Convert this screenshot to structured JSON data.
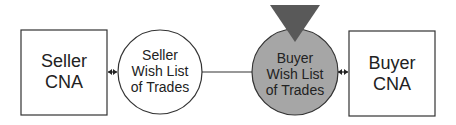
{
  "seller_cna": {
    "line1": "Seller",
    "line2": "CNA"
  },
  "seller_wish_list": {
    "line1": "Seller",
    "line2": "Wish List",
    "line3": "of Trades"
  },
  "buyer_wish_list": {
    "line1": "Buyer",
    "line2": "Wish List",
    "line3": "of Trades",
    "fill": "#a6a6a6"
  },
  "buyer_cna": {
    "line1": "Buyer",
    "line2": "CNA"
  },
  "marker": {
    "shape": "down-triangle",
    "fill": "#595959"
  }
}
